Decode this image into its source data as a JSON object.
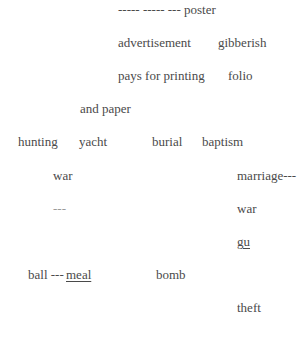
{
  "words": [
    {
      "text": "----- ----- --- poster",
      "x": 118,
      "y": 2
    },
    {
      "text": "advertisement",
      "x": 118,
      "y": 35
    },
    {
      "text": "gibberish",
      "x": 218,
      "y": 35
    },
    {
      "text": "pays for printing",
      "x": 118,
      "y": 68
    },
    {
      "text": "folio",
      "x": 228,
      "y": 68
    },
    {
      "text": "and paper",
      "x": 80,
      "y": 101
    },
    {
      "text": "hunting",
      "x": 18,
      "y": 134
    },
    {
      "text": "yacht",
      "x": 79,
      "y": 134
    },
    {
      "text": "burial",
      "x": 152,
      "y": 134
    },
    {
      "text": "baptism",
      "x": 202,
      "y": 134
    },
    {
      "text": "war",
      "x": 53,
      "y": 168
    },
    {
      "text": "marriage---",
      "x": 237,
      "y": 168
    },
    {
      "text": "---",
      "x": 53,
      "y": 201,
      "faint": true
    },
    {
      "text": "war",
      "x": 237,
      "y": 201
    },
    {
      "text": "gu",
      "x": 237,
      "y": 234,
      "underline": true
    },
    {
      "text": "ball ---",
      "x": 28,
      "y": 267
    },
    {
      "text": "meal",
      "x": 66,
      "y": 267,
      "underline": true
    },
    {
      "text": "bomb",
      "x": 156,
      "y": 267
    },
    {
      "text": "theft",
      "x": 237,
      "y": 300
    }
  ]
}
